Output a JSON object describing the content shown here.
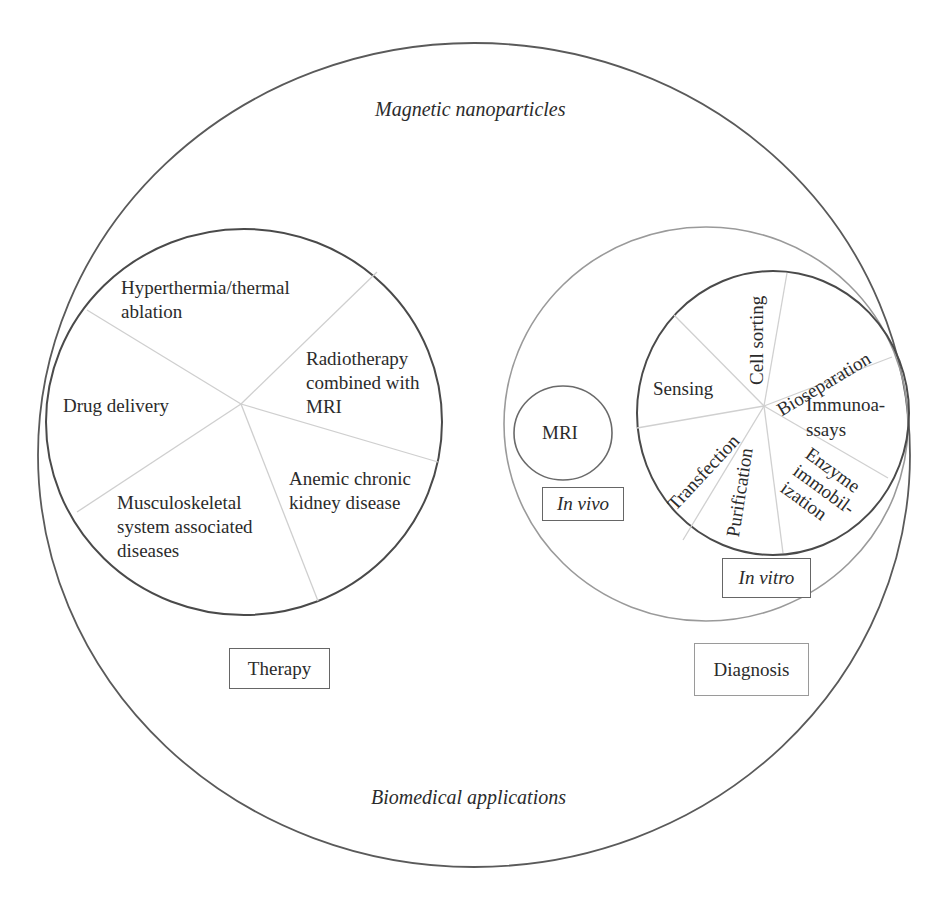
{
  "diagram": {
    "outer": {
      "title_top": "Magnetic nanoparticles",
      "title_bottom": "Biomedical applications"
    },
    "therapy": {
      "label": "Therapy",
      "segments": [
        {
          "label": "Hyperthermia/thermal\nablation"
        },
        {
          "label": "Radiotherapy\ncombined with\nMRI"
        },
        {
          "label": "Anemic chronic\nkidney disease"
        },
        {
          "label": "Musculoskeletal\nsystem associated\ndiseases"
        },
        {
          "label": "Drug delivery"
        }
      ]
    },
    "diagnosis": {
      "label": "Diagnosis",
      "in_vivo": {
        "label": "In vivo",
        "items": [
          {
            "label": "MRI"
          }
        ]
      },
      "in_vitro": {
        "label": "In vitro",
        "segments": [
          {
            "label": "Sensing"
          },
          {
            "label": "Cell sorting"
          },
          {
            "label": "Bioseparation"
          },
          {
            "label": "Immunoa-\nssays"
          },
          {
            "label": "Enzyme\nimmobil-\nization"
          },
          {
            "label": "Purification"
          },
          {
            "label": "Transfection"
          }
        ]
      }
    },
    "colors": {
      "dark_stroke": "#555555",
      "light_stroke": "#9a9a9a",
      "divider": "#d0d0d0",
      "text": "#2b2b2b"
    }
  }
}
